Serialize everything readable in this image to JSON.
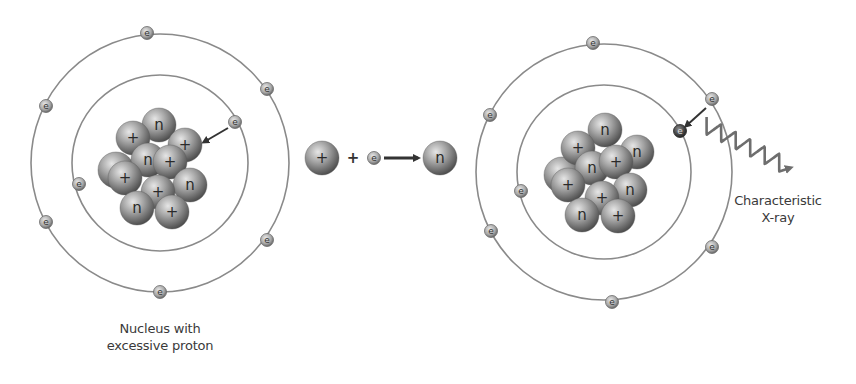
{
  "diagram": {
    "colors": {
      "orbit": "#8a8a8a",
      "sphere_light": "#d8d8d8",
      "sphere_mid": "#9a9a9a",
      "sphere_dark": "#4a4a4a",
      "electron_fill": "#bdbdbd",
      "electron_dark": "#3c3c3c",
      "arrow": "#333333",
      "xray_wave": "#6e6e6e",
      "text": "#3a3a3a"
    },
    "symbols": {
      "proton": "+",
      "neutron": "n",
      "electron": "e",
      "plus_operator": "+"
    },
    "left_atom": {
      "label_line1": "Nucleus with",
      "label_line2": "excessive proton",
      "center": [
        160,
        163
      ],
      "outer_orbit_radius": 129,
      "inner_orbit_radius": 88,
      "nucleus": [
        {
          "type": "back",
          "x": 116,
          "y": 170
        },
        {
          "type": "neutron",
          "x": 159,
          "y": 125
        },
        {
          "type": "proton",
          "x": 133,
          "y": 138
        },
        {
          "type": "proton",
          "x": 185,
          "y": 145
        },
        {
          "type": "neutron",
          "x": 148,
          "y": 160
        },
        {
          "type": "proton",
          "x": 170,
          "y": 162
        },
        {
          "type": "proton",
          "x": 125,
          "y": 178
        },
        {
          "type": "neutron",
          "x": 190,
          "y": 185
        },
        {
          "type": "proton",
          "x": 158,
          "y": 192
        },
        {
          "type": "neutron",
          "x": 137,
          "y": 208
        },
        {
          "type": "proton",
          "x": 172,
          "y": 212
        }
      ],
      "electrons": [
        {
          "x": 147,
          "y": 33,
          "shell": "outer"
        },
        {
          "x": 267,
          "y": 89,
          "shell": "outer"
        },
        {
          "x": 46,
          "y": 106,
          "shell": "outer"
        },
        {
          "x": 46,
          "y": 222,
          "shell": "outer"
        },
        {
          "x": 267,
          "y": 240,
          "shell": "outer"
        },
        {
          "x": 160,
          "y": 292,
          "shell": "outer"
        },
        {
          "x": 235,
          "y": 122,
          "shell": "inner",
          "captured": true
        },
        {
          "x": 79,
          "y": 184,
          "shell": "inner"
        }
      ],
      "capture_arrow": {
        "from": [
          228,
          128
        ],
        "to": [
          204,
          142
        ]
      }
    },
    "reaction": {
      "proton": {
        "x": 322,
        "y": 158,
        "symbol": "+"
      },
      "operator": {
        "x": 353,
        "y": 158,
        "symbol": "+"
      },
      "electron": {
        "x": 374,
        "y": 158,
        "symbol": "e"
      },
      "arrow": {
        "from": [
          384,
          158
        ],
        "to": [
          418,
          158
        ]
      },
      "neutron": {
        "x": 440,
        "y": 158,
        "symbol": "n"
      }
    },
    "right_atom": {
      "label_line1": "Characteristic",
      "label_line2": "X-ray",
      "center": [
        604,
        172
      ],
      "outer_orbit_radius": 128,
      "inner_orbit_radius": 87,
      "nucleus": [
        {
          "type": "back",
          "x": 562,
          "y": 175
        },
        {
          "type": "neutron",
          "x": 605,
          "y": 130
        },
        {
          "type": "proton",
          "x": 578,
          "y": 148
        },
        {
          "type": "neutron",
          "x": 637,
          "y": 152
        },
        {
          "type": "neutron",
          "x": 592,
          "y": 168
        },
        {
          "type": "proton",
          "x": 616,
          "y": 162
        },
        {
          "type": "proton",
          "x": 568,
          "y": 185
        },
        {
          "type": "neutron",
          "x": 630,
          "y": 190
        },
        {
          "type": "proton",
          "x": 602,
          "y": 198
        },
        {
          "type": "neutron",
          "x": 582,
          "y": 215
        },
        {
          "type": "proton",
          "x": 618,
          "y": 216
        }
      ],
      "electrons": [
        {
          "x": 593,
          "y": 43,
          "shell": "outer"
        },
        {
          "x": 712,
          "y": 99,
          "shell": "outer"
        },
        {
          "x": 490,
          "y": 115,
          "shell": "outer"
        },
        {
          "x": 491,
          "y": 231,
          "shell": "outer"
        },
        {
          "x": 712,
          "y": 247,
          "shell": "outer"
        },
        {
          "x": 612,
          "y": 302,
          "shell": "outer"
        },
        {
          "x": 680,
          "y": 131,
          "shell": "inner",
          "filled_vacancy": true
        },
        {
          "x": 521,
          "y": 191,
          "shell": "inner"
        }
      ],
      "transition_arrow": {
        "from": [
          706,
          108
        ],
        "to": [
          686,
          126
        ]
      },
      "xray_wave": {
        "from": [
          703,
          124
        ],
        "to": [
          790,
          168
        ]
      }
    }
  }
}
